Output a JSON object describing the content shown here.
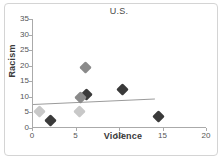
{
  "chart_data": {
    "type": "scatter",
    "title": "U.S.",
    "xlabel": "Violence",
    "ylabel": "Racism",
    "xlim": [
      0,
      20
    ],
    "ylim": [
      0,
      35
    ],
    "xticks": [
      0,
      5,
      10,
      15,
      20
    ],
    "yticks": [
      0,
      5,
      10,
      15,
      20,
      25,
      30,
      35
    ],
    "grid": false,
    "legend": "none",
    "series": [
      {
        "name": "dark-points",
        "color": "#3a3a3a",
        "points": [
          {
            "x": 2.1,
            "y": 2.3
          },
          {
            "x": 6.3,
            "y": 10.6
          },
          {
            "x": 10.4,
            "y": 12.3
          },
          {
            "x": 14.5,
            "y": 3.6
          }
        ]
      },
      {
        "name": "medium-gray-points",
        "color": "#8a8a8a",
        "points": [
          {
            "x": 5.6,
            "y": 9.7
          },
          {
            "x": 6.2,
            "y": 19.5
          }
        ]
      },
      {
        "name": "light-gray-points",
        "color": "#c8c8c8",
        "points": [
          {
            "x": 0.9,
            "y": 5.4
          },
          {
            "x": 5.5,
            "y": 5.2
          }
        ]
      }
    ],
    "trendline": {
      "name": "linear-fit",
      "color": "#9b9b9b",
      "x0": 0.15,
      "y0": 7.8,
      "x1": 14.2,
      "y1": 9.6
    }
  },
  "colors": {
    "frame": "#d4d4d4",
    "axis": "#aaaaaa",
    "tick_text": "#555555",
    "title_text": "#4a4a4a",
    "axis_title_text": "#3a3a3a",
    "background": "#ffffff"
  }
}
